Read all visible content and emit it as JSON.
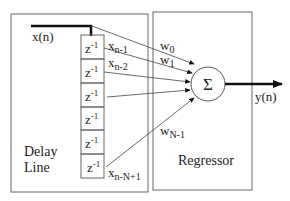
{
  "diagram": {
    "input_label": "x(n)",
    "output_label": "y(n)",
    "delay_line_label_1": "Delay",
    "delay_line_label_2": "Line",
    "regressor_label": "Regressor",
    "sum_symbol": "Σ",
    "delay_cells": [
      "z",
      "z",
      "z",
      "z",
      "z",
      "z"
    ],
    "delay_exponent": "-1",
    "taps": [
      {
        "base": "x",
        "sub": "n-1"
      },
      {
        "base": "x",
        "sub": "n-2"
      },
      {
        "base": "x",
        "sub": "n-N+1"
      }
    ],
    "weights": [
      {
        "base": "w",
        "sub": "0"
      },
      {
        "base": "w",
        "sub": "1"
      },
      {
        "base": "w",
        "sub": "N-1"
      }
    ],
    "colors": {
      "line": "#555555",
      "thick": "#111111",
      "text": "#222222"
    }
  }
}
